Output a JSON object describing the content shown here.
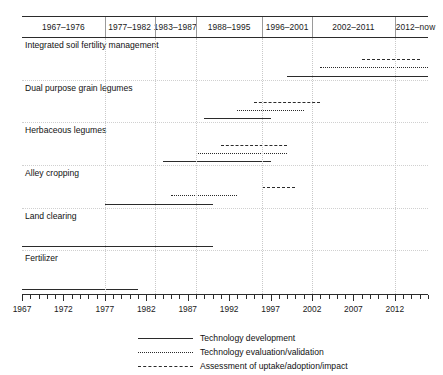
{
  "chart_data": {
    "type": "table",
    "title": "",
    "subtitle": "",
    "xlabel": "",
    "ylabel": "",
    "xlim": [
      1967,
      2016
    ],
    "grid": true,
    "legend_position": "bottom-center",
    "axis": {
      "start_year": 1967,
      "end_year": 2016,
      "tick_labels": [
        "1967",
        "1972",
        "1977",
        "1982",
        "1987",
        "1992",
        "1997",
        "2002",
        "2007",
        "2012"
      ],
      "tick_values": [
        1967,
        1972,
        1977,
        1982,
        1987,
        1992,
        1997,
        2002,
        2007,
        2012
      ],
      "minor_tick_step": 1,
      "major_tick_step": 5
    },
    "period_columns": [
      {
        "label": "1967–1976",
        "start": 1967,
        "end": 1976
      },
      {
        "label": "1977–1982",
        "start": 1977,
        "end": 1982
      },
      {
        "label": "1983–1987",
        "start": 1983,
        "end": 1987
      },
      {
        "label": "1988–1995",
        "start": 1988,
        "end": 1995
      },
      {
        "label": "1996–2001",
        "start": 1996,
        "end": 2001
      },
      {
        "label": "2002–2011",
        "start": 2002,
        "end": 2011
      },
      {
        "label": "2012–now",
        "start": 2012,
        "end": 2016
      }
    ],
    "categories": [
      "Integrated soil fertility management",
      "Dual purpose grain legumes",
      "Herbaceous legumes",
      "Alley cropping",
      "Land clearing",
      "Fertilizer"
    ],
    "series": [
      {
        "name": "Technology development",
        "style": "solid",
        "values": [
          {
            "category": "Integrated soil fertility management",
            "start": 1999,
            "end": 2016
          },
          {
            "category": "Dual purpose grain legumes",
            "start": 1989,
            "end": 1997
          },
          {
            "category": "Herbaceous legumes",
            "start": 1984,
            "end": 1997
          },
          {
            "category": "Alley cropping",
            "start": 1977,
            "end": 1990
          },
          {
            "category": "Land clearing",
            "start": 1967,
            "end": 1990
          },
          {
            "category": "Fertilizer",
            "start": 1967,
            "end": 1981
          }
        ]
      },
      {
        "name": "Technology evaluation/validation",
        "style": "dotted",
        "values": [
          {
            "category": "Integrated soil fertility management",
            "start": 2003,
            "end": 2016
          },
          {
            "category": "Dual purpose grain legumes",
            "start": 1993,
            "end": 2001
          },
          {
            "category": "Herbaceous legumes",
            "start": 1988,
            "end": 1999
          },
          {
            "category": "Alley cropping",
            "start": 1985,
            "end": 1993
          },
          {
            "category": "Land clearing",
            "start": null,
            "end": null
          },
          {
            "category": "Fertilizer",
            "start": null,
            "end": null
          }
        ]
      },
      {
        "name": "Assessment of uptake/adoption/impact",
        "style": "dashed",
        "values": [
          {
            "category": "Integrated soil fertility management",
            "start": 2008,
            "end": 2015
          },
          {
            "category": "Dual purpose grain legumes",
            "start": 1995,
            "end": 2003
          },
          {
            "category": "Herbaceous legumes",
            "start": 1991,
            "end": 1999
          },
          {
            "category": "Alley cropping",
            "start": 1996,
            "end": 2000
          },
          {
            "category": "Land clearing",
            "start": null,
            "end": null
          },
          {
            "category": "Fertilizer",
            "start": null,
            "end": null
          }
        ]
      }
    ]
  },
  "legend": {
    "items": [
      {
        "label": "Technology development",
        "style": "solid"
      },
      {
        "label": "Technology evaluation/validation",
        "style": "dotted"
      },
      {
        "label": "Assessment of uptake/adoption/impact",
        "style": "dashed"
      }
    ]
  }
}
